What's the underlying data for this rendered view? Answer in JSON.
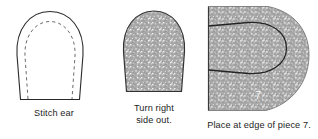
{
  "document": {
    "type": "sewing-instruction-diagram",
    "background_color": "#ffffff",
    "ink_color": "#1d1d1d",
    "fabric_fill_color": "#a8a8a8",
    "panel_count": 3
  },
  "panels": [
    {
      "id": "stitch-ear",
      "caption": "Stitch ear",
      "figure_name": "ear-outline-with-stitch-line",
      "description_visible": "ear piece outline with dashed stitching line inside",
      "has_dashed_stitch_line": true,
      "is_shaded": false
    },
    {
      "id": "turn-right",
      "caption": "Turn right\nside out.",
      "caption_line_1": "Turn right",
      "caption_line_2": "side out.",
      "figure_name": "ear-shaded",
      "description_visible": "ear piece filled with speckled fabric texture",
      "has_dashed_stitch_line": false,
      "is_shaded": true
    },
    {
      "id": "place-edge",
      "caption": "Place at edge of piece 7.",
      "figure_name": "piece-seven-with-ear-placement",
      "piece_number_label": "7",
      "description_visible": "shaded body piece 7 with ear outline placed at its left edge",
      "has_dashed_stitch_line": false,
      "is_shaded": true
    }
  ]
}
